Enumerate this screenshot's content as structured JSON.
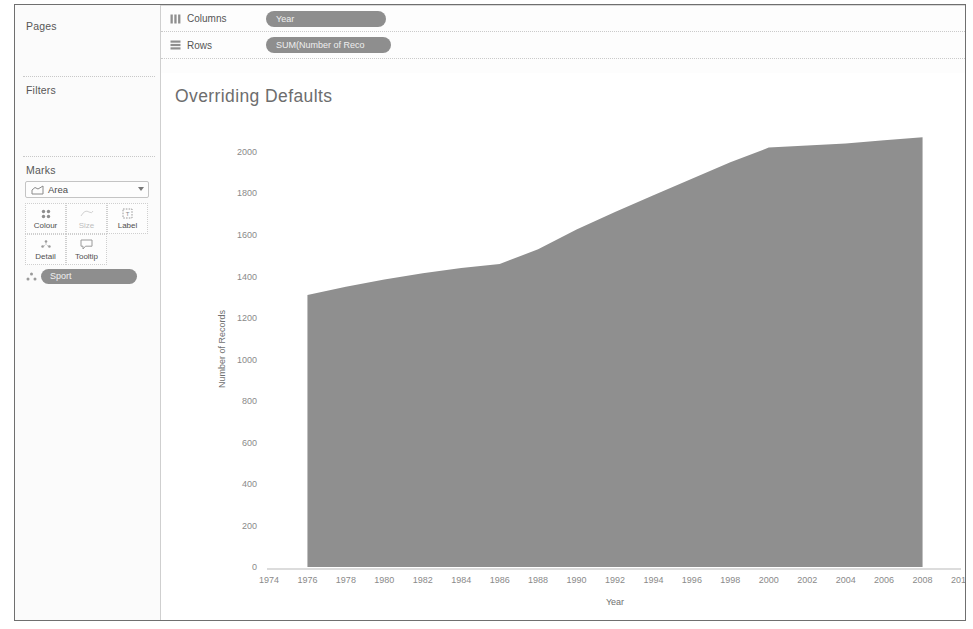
{
  "sidebar": {
    "pages_label": "Pages",
    "filters_label": "Filters",
    "marks_label": "Marks",
    "mark_type": "Area",
    "buttons": [
      {
        "name": "colour",
        "label": "Colour",
        "enabled": true
      },
      {
        "name": "size",
        "label": "Size",
        "enabled": false
      },
      {
        "name": "label",
        "label": "Label",
        "enabled": true
      },
      {
        "name": "detail",
        "label": "Detail",
        "enabled": true
      },
      {
        "name": "tooltip",
        "label": "Tooltip",
        "enabled": true
      }
    ],
    "card_pill": "Sport"
  },
  "shelves": {
    "columns_label": "Columns",
    "columns_pill": "Year",
    "rows_label": "Rows",
    "rows_pill": "SUM(Number of Reco"
  },
  "viz": {
    "title": "Overriding Defaults"
  },
  "icons": {
    "columns": "columns-icon",
    "rows": "rows-icon",
    "area_mark": "area-mark-icon",
    "colour": "colour-icon",
    "size": "size-icon",
    "label": "label-icon",
    "detail": "detail-icon",
    "tooltip": "tooltip-icon",
    "caret": "chevron-down-icon"
  },
  "colors": {
    "area_fill": "#8f8f8f",
    "pill_bg": "#8e8e8e",
    "axis": "#b9b9b9",
    "title_text": "#6d6d6d",
    "panel_bg": "#fbfbfb"
  },
  "chart_data": {
    "type": "area",
    "title": "Overriding Defaults",
    "xlabel": "Year",
    "ylabel": "Number of Records",
    "xlim": [
      1974,
      2010
    ],
    "ylim": [
      0,
      2100
    ],
    "xticks": [
      1974,
      1976,
      1978,
      1980,
      1982,
      1984,
      1986,
      1988,
      1990,
      1992,
      1994,
      1996,
      1998,
      2000,
      2002,
      2004,
      2006,
      2008,
      2010
    ],
    "yticks": [
      0,
      200,
      400,
      600,
      800,
      1000,
      1200,
      1400,
      1600,
      1800,
      2000
    ],
    "grid": false,
    "legend": "none",
    "x": [
      1976,
      1978,
      1980,
      1982,
      1984,
      1986,
      1988,
      1990,
      1992,
      1994,
      1996,
      1998,
      2000,
      2002,
      2004,
      2006,
      2008
    ],
    "series": [
      {
        "name": "Number of Records",
        "values": [
          1310,
          1350,
          1385,
          1415,
          1440,
          1460,
          1530,
          1625,
          1710,
          1790,
          1870,
          1950,
          2020,
          2030,
          2040,
          2055,
          2070
        ]
      }
    ]
  }
}
